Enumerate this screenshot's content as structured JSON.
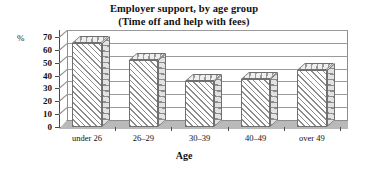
{
  "chart_data": {
    "type": "bar",
    "title": "Employer support, by age group",
    "subtitle": "(Time off and help with fees)",
    "title_lines": [
      "Employer support, by age group",
      "(Time off and help with fees)"
    ],
    "categories": [
      "under 26",
      "26–29",
      "30–39",
      "40–49",
      "over 49"
    ],
    "values": [
      65,
      52,
      36,
      37,
      44
    ],
    "xlabel": "Age",
    "ylabel": "%",
    "unit": "%",
    "ylim": [
      0,
      70
    ],
    "yticks": [
      0,
      10,
      20,
      30,
      40,
      50,
      60,
      70
    ],
    "ytick_labels": [
      "0",
      "10",
      "20",
      "30",
      "40",
      "50",
      "60",
      "70"
    ],
    "grid": true,
    "legend": false,
    "style": "3d-hatched-bars",
    "colors": {
      "bar_fill": "#ffffff",
      "bar_hatch": "#8c8c8c",
      "bar_outline": "#707070",
      "axis": "#4a4a4a",
      "gridline": "#9a9a9a",
      "floor": "#b9b9b9",
      "text": "#111111",
      "background": "#ffffff"
    }
  }
}
